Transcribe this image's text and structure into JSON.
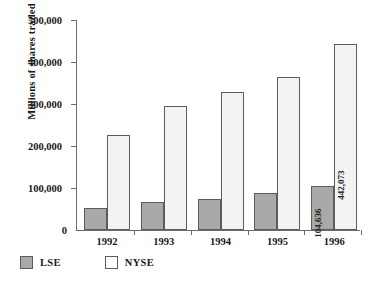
{
  "chart_data": {
    "type": "bar",
    "title": "",
    "xlabel": "",
    "ylabel": "Millions of shares traded",
    "categories": [
      "1992",
      "1993",
      "1994",
      "1995",
      "1996"
    ],
    "ylim": [
      0,
      500000
    ],
    "ytick_labels": [
      "0",
      "100,000",
      "200,000",
      "300,000",
      "400,000",
      "500,000"
    ],
    "ytick_values": [
      0,
      100000,
      200000,
      300000,
      400000,
      500000
    ],
    "grid": false,
    "legend_position": "bottom-left",
    "series": [
      {
        "name": "LSE",
        "color": "#a9a9a7",
        "values": [
          52000,
          67000,
          73000,
          87000,
          104636
        ],
        "labels": [
          "",
          "",
          "",
          "",
          "104,636"
        ]
      },
      {
        "name": "NYSE",
        "color": "#f3f3f1",
        "values": [
          227000,
          295000,
          328000,
          364000,
          442073
        ],
        "labels": [
          "",
          "",
          "",
          "",
          "442,073"
        ]
      }
    ]
  },
  "axis": {
    "y_title": "Millions of shares traded",
    "zero_label": "0"
  },
  "legend": {
    "items": [
      {
        "label": "LSE",
        "swatch": "lse-swatch"
      },
      {
        "label": "NYSE",
        "swatch": "nyse-swatch"
      }
    ]
  }
}
